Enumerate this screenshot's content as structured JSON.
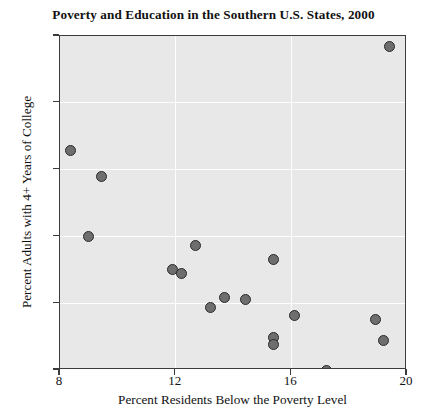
{
  "chart_data": {
    "type": "scatter",
    "title": "Poverty and Education in the Southern U.S. States, 2000",
    "xlabel": "Percent Residents Below the Poverty Level",
    "ylabel": "Percent Adults with 4+ Years of College",
    "xlim": [
      8,
      20
    ],
    "ylim": [
      15,
      40
    ],
    "xticks": [
      8,
      12,
      16,
      20
    ],
    "yticks": [
      15,
      20,
      25,
      30,
      35,
      40
    ],
    "xtick_labels": [
      "8",
      "12",
      "16",
      "20"
    ],
    "ytick_labels": [
      "15",
      "20",
      "25",
      "30",
      "35",
      "40"
    ],
    "grid": true,
    "grid_color": "#fdfdfd",
    "plot_background": "#e8e8e8",
    "marker_fill": "#6e6e6e",
    "marker_edge": "#2a2a2a",
    "legend": null,
    "points": [
      {
        "x": 8.35,
        "y": 31.4
      },
      {
        "x": 9.45,
        "y": 29.5
      },
      {
        "x": 9.0,
        "y": 25.0
      },
      {
        "x": 11.9,
        "y": 22.5
      },
      {
        "x": 12.2,
        "y": 22.2
      },
      {
        "x": 12.7,
        "y": 24.3
      },
      {
        "x": 13.2,
        "y": 19.7
      },
      {
        "x": 13.7,
        "y": 20.4
      },
      {
        "x": 14.4,
        "y": 20.3
      },
      {
        "x": 15.4,
        "y": 23.3
      },
      {
        "x": 15.4,
        "y": 17.4
      },
      {
        "x": 15.4,
        "y": 16.9
      },
      {
        "x": 16.1,
        "y": 19.1
      },
      {
        "x": 17.2,
        "y": 15.0
      },
      {
        "x": 18.9,
        "y": 18.8
      },
      {
        "x": 19.2,
        "y": 17.2
      },
      {
        "x": 19.4,
        "y": 39.2
      }
    ]
  }
}
